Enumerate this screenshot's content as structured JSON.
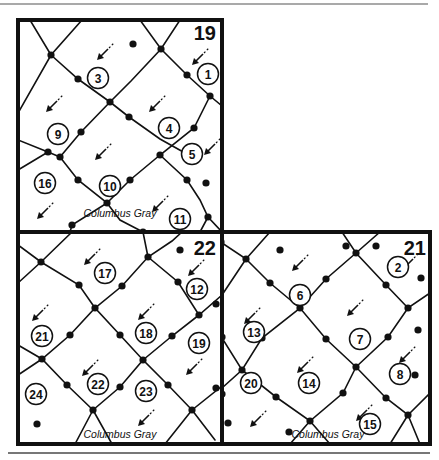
{
  "diagram": {
    "street_name": "Columbus Gray",
    "colors": {
      "ink": "#111111",
      "paper": "#ffffff",
      "rule": "#555555"
    },
    "sections": [
      {
        "id": "19",
        "label": "19",
        "box": [
          18,
          20,
          222,
          232
        ],
        "label_pos": [
          216,
          40
        ],
        "street_label_pos": [
          120,
          217
        ],
        "roads": [
          [
            [
              18,
              113
            ],
            [
              51,
              55
            ],
            [
              82,
              20
            ]
          ],
          [
            [
              51,
              55
            ],
            [
              78,
              79
            ],
            [
              110,
              102
            ],
            [
              129,
              117
            ],
            [
              160,
              139
            ],
            [
              194,
              158
            ]
          ],
          [
            [
              140,
              20
            ],
            [
              161,
              49
            ],
            [
              187,
              75
            ],
            [
              210,
              96
            ],
            [
              222,
              106
            ]
          ],
          [
            [
              51,
              55
            ],
            [
              30,
              20
            ]
          ],
          [
            [
              18,
              140
            ],
            [
              48,
              152
            ],
            [
              60,
              157
            ],
            [
              81,
              132
            ],
            [
              110,
              102
            ],
            [
              131,
              81
            ],
            [
              161,
              49
            ],
            [
              180,
              20
            ]
          ],
          [
            [
              18,
              170
            ],
            [
              48,
              152
            ]
          ],
          [
            [
              60,
              157
            ],
            [
              78,
              180
            ],
            [
              107,
              203
            ],
            [
              130,
              180
            ],
            [
              160,
              155
            ],
            [
              194,
              128
            ],
            [
              210,
              96
            ]
          ],
          [
            [
              160,
              155
            ],
            [
              187,
              180
            ],
            [
              200,
              200
            ],
            [
              208,
              217
            ],
            [
              222,
              232
            ]
          ],
          [
            [
              208,
              217
            ],
            [
              200,
              232
            ]
          ],
          [
            [
              107,
              203
            ],
            [
              72,
              225
            ],
            [
              70,
              232
            ]
          ],
          [
            [
              107,
              203
            ],
            [
              120,
              220
            ],
            [
              143,
              232
            ]
          ]
        ],
        "nodes": [
          [
            51,
            55
          ],
          [
            78,
            79
          ],
          [
            110,
            102
          ],
          [
            129,
            117
          ],
          [
            161,
            49
          ],
          [
            187,
            75
          ],
          [
            210,
            96
          ],
          [
            48,
            152
          ],
          [
            60,
            157
          ],
          [
            81,
            132
          ],
          [
            160,
            155
          ],
          [
            194,
            128
          ],
          [
            187,
            180
          ],
          [
            78,
            180
          ],
          [
            107,
            203
          ],
          [
            130,
            180
          ],
          [
            208,
            217
          ],
          [
            133,
            44
          ],
          [
            206,
            183
          ],
          [
            72,
            225
          ],
          [
            143,
            232
          ]
        ],
        "lots": [
          {
            "n": "1",
            "x": 208,
            "y": 74
          },
          {
            "n": "3",
            "x": 98,
            "y": 78
          },
          {
            "n": "4",
            "x": 169,
            "y": 128
          },
          {
            "n": "5",
            "x": 192,
            "y": 154
          },
          {
            "n": "9",
            "x": 58,
            "y": 134
          },
          {
            "n": "10",
            "x": 110,
            "y": 186
          },
          {
            "n": "11",
            "x": 180,
            "y": 219
          },
          {
            "n": "16",
            "x": 45,
            "y": 183
          }
        ],
        "arrows": [
          [
            105,
            52
          ],
          [
            200,
            57
          ],
          [
            54,
            104
          ],
          [
            157,
            104
          ],
          [
            103,
            152
          ],
          [
            212,
            147
          ],
          [
            45,
            211
          ],
          [
            160,
            204
          ]
        ]
      },
      {
        "id": "22",
        "label": "22",
        "box": [
          18,
          232,
          222,
          444
        ],
        "label_pos": [
          216,
          255
        ],
        "street_label_pos": [
          120,
          438
        ],
        "roads": [
          [
            [
              18,
              283
            ],
            [
              41,
              262
            ],
            [
              72,
              232
            ]
          ],
          [
            [
              18,
              245
            ],
            [
              41,
              262
            ],
            [
              79,
              285
            ],
            [
              95,
              308
            ],
            [
              122,
              286
            ],
            [
              148,
              257
            ],
            [
              172,
              241
            ],
            [
              182,
              232
            ]
          ],
          [
            [
              148,
              257
            ],
            [
              143,
              232
            ]
          ],
          [
            [
              148,
              257
            ],
            [
              178,
              282
            ],
            [
              199,
              315
            ],
            [
              222,
              295
            ]
          ],
          [
            [
              18,
              375
            ],
            [
              42,
              359
            ],
            [
              70,
              335
            ],
            [
              95,
              308
            ],
            [
              120,
              335
            ],
            [
              143,
              360
            ],
            [
              172,
              336
            ],
            [
              199,
              315
            ]
          ],
          [
            [
              18,
              345
            ],
            [
              42,
              359
            ],
            [
              67,
              385
            ],
            [
              93,
              410
            ],
            [
              120,
              387
            ],
            [
              143,
              360
            ],
            [
              168,
              385
            ],
            [
              192,
              410
            ],
            [
              222,
              386
            ]
          ],
          [
            [
              93,
              410
            ],
            [
              75,
              444
            ]
          ],
          [
            [
              93,
              410
            ],
            [
              112,
              444
            ]
          ],
          [
            [
              192,
              410
            ],
            [
              165,
              444
            ]
          ],
          [
            [
              192,
              410
            ],
            [
              215,
              440
            ]
          ]
        ],
        "nodes": [
          [
            41,
            262
          ],
          [
            79,
            285
          ],
          [
            95,
            308
          ],
          [
            122,
            286
          ],
          [
            148,
            257
          ],
          [
            180,
            250
          ],
          [
            178,
            282
          ],
          [
            199,
            315
          ],
          [
            70,
            335
          ],
          [
            120,
            335
          ],
          [
            143,
            360
          ],
          [
            172,
            336
          ],
          [
            42,
            359
          ],
          [
            67,
            385
          ],
          [
            93,
            410
          ],
          [
            120,
            387
          ],
          [
            168,
            385
          ],
          [
            192,
            410
          ],
          [
            216,
            304
          ],
          [
            216,
            388
          ],
          [
            37,
            424
          ]
        ],
        "lots": [
          {
            "n": "12",
            "x": 197,
            "y": 289
          },
          {
            "n": "17",
            "x": 105,
            "y": 273
          },
          {
            "n": "18",
            "x": 146,
            "y": 333
          },
          {
            "n": "19",
            "x": 199,
            "y": 343
          },
          {
            "n": "21",
            "x": 42,
            "y": 336
          },
          {
            "n": "22",
            "x": 98,
            "y": 384
          },
          {
            "n": "23",
            "x": 146,
            "y": 391
          },
          {
            "n": "24",
            "x": 36,
            "y": 394
          }
        ],
        "arrows": [
          [
            92,
            257
          ],
          [
            196,
            268
          ],
          [
            40,
            313
          ],
          [
            146,
            312
          ],
          [
            90,
            368
          ],
          [
            194,
            367
          ],
          [
            146,
            418
          ]
        ]
      },
      {
        "id": "21",
        "label": "21",
        "box": [
          222,
          232,
          430,
          444
        ],
        "label_pos": [
          426,
          255
        ],
        "street_label_pos": [
          328,
          438
        ],
        "roads": [
          [
            [
              222,
              243
            ],
            [
              246,
              259
            ],
            [
              270,
              232
            ]
          ],
          [
            [
              246,
              259
            ],
            [
              270,
              283
            ],
            [
              300,
              308
            ],
            [
              326,
              279
            ],
            [
              356,
              253
            ],
            [
              380,
              232
            ]
          ],
          [
            [
              342,
              232
            ],
            [
              356,
              253
            ],
            [
              386,
              285
            ],
            [
              408,
              308
            ],
            [
              430,
              293
            ]
          ],
          [
            [
              222,
              295
            ],
            [
              246,
              259
            ]
          ],
          [
            [
              222,
              388
            ],
            [
              242,
              370
            ],
            [
              262,
              338
            ],
            [
              300,
              308
            ],
            [
              326,
              339
            ],
            [
              356,
              367
            ],
            [
              388,
              337
            ],
            [
              408,
              308
            ]
          ],
          [
            [
              222,
              338
            ],
            [
              242,
              370
            ],
            [
              276,
              397
            ],
            [
              310,
              421
            ],
            [
              343,
              393
            ],
            [
              356,
              367
            ]
          ],
          [
            [
              356,
              367
            ],
            [
              386,
              398
            ],
            [
              408,
              415
            ],
            [
              430,
              393
            ]
          ],
          [
            [
              310,
              421
            ],
            [
              290,
              444
            ]
          ],
          [
            [
              310,
              421
            ],
            [
              330,
              444
            ]
          ],
          [
            [
              408,
              415
            ],
            [
              390,
              444
            ]
          ],
          [
            [
              408,
              415
            ],
            [
              420,
              444
            ]
          ]
        ],
        "nodes": [
          [
            246,
            259
          ],
          [
            270,
            283
          ],
          [
            300,
            308
          ],
          [
            326,
            279
          ],
          [
            356,
            253
          ],
          [
            386,
            285
          ],
          [
            408,
            308
          ],
          [
            242,
            370
          ],
          [
            262,
            338
          ],
          [
            326,
            339
          ],
          [
            356,
            367
          ],
          [
            388,
            337
          ],
          [
            276,
            397
          ],
          [
            310,
            421
          ],
          [
            343,
            393
          ],
          [
            386,
            398
          ],
          [
            408,
            415
          ],
          [
            221,
            242
          ],
          [
            222,
            337
          ],
          [
            222,
            394
          ],
          [
            228,
            423
          ],
          [
            280,
            250
          ],
          [
            346,
            246
          ],
          [
            376,
            246
          ],
          [
            421,
            278
          ],
          [
            418,
            330
          ],
          [
            415,
            375
          ],
          [
            289,
            432
          ]
        ],
        "lots": [
          {
            "n": "2",
            "x": 398,
            "y": 267
          },
          {
            "n": "6",
            "x": 300,
            "y": 295
          },
          {
            "n": "7",
            "x": 360,
            "y": 339
          },
          {
            "n": "8",
            "x": 400,
            "y": 374
          },
          {
            "n": "13",
            "x": 254,
            "y": 332
          },
          {
            "n": "14",
            "x": 309,
            "y": 383
          },
          {
            "n": "15",
            "x": 370,
            "y": 424
          },
          {
            "n": "20",
            "x": 251,
            "y": 383
          }
        ],
        "arrows": [
          [
            300,
            263
          ],
          [
            252,
            316
          ],
          [
            355,
            308
          ],
          [
            407,
            355
          ],
          [
            305,
            365
          ],
          [
            258,
            419
          ],
          [
            364,
            413
          ],
          [
            410,
            262
          ]
        ]
      }
    ]
  }
}
